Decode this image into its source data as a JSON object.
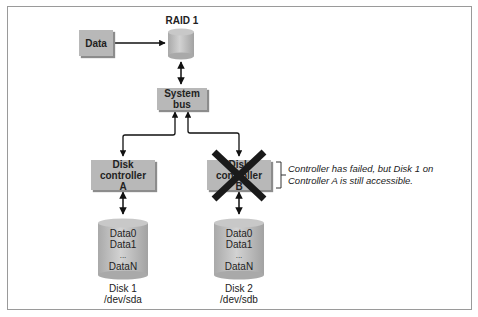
{
  "diagram": {
    "raid_label": "RAID 1",
    "data_box": "Data",
    "system_bus": "System bus",
    "controller_a": {
      "line1": "Disk controller",
      "line2": "A"
    },
    "controller_b": {
      "line1": "Disk controller",
      "line2": "B",
      "status": "failed"
    },
    "annotation": {
      "line1": "Controller has failed, but Disk 1 on",
      "line2": "Controller A is still accessible."
    },
    "disk1": {
      "rows": [
        "Data0",
        "Data1",
        "...",
        "DataN"
      ],
      "name": "Disk 1",
      "device": "/dev/sda"
    },
    "disk2": {
      "rows": [
        "Data0",
        "Data1",
        "...",
        "DataN"
      ],
      "name": "Disk 2",
      "device": "/dev/sdb"
    },
    "colors": {
      "box_fill": "#b8b8b8",
      "cross": "#1a1a1a",
      "arrow": "#111111"
    }
  }
}
